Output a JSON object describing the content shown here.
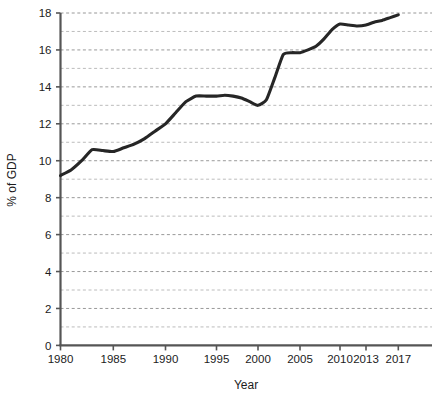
{
  "chart_data": {
    "type": "line",
    "title": "",
    "xlabel": "Year",
    "ylabel": "% of GDP",
    "xlim": [
      1980,
      2018.5
    ],
    "ylim": [
      0,
      18
    ],
    "grid": true,
    "grid_axis": "y",
    "legend": "none",
    "line_color": "#262626",
    "x_tick_labels": [
      "1980",
      "1985",
      "1990",
      "1995",
      "2000",
      "2005",
      "2010",
      "2013",
      "2017"
    ],
    "x_ticks": [
      1980,
      1985,
      1990,
      1995,
      2000,
      2005,
      2010,
      2013,
      2017
    ],
    "y_tick_labels": [
      "0",
      "2",
      "4",
      "6",
      "8",
      "10",
      "12",
      "14",
      "16",
      "18"
    ],
    "y_ticks": [
      0,
      2,
      4,
      6,
      8,
      10,
      12,
      14,
      16,
      18
    ],
    "y_gridlines": [
      1,
      2,
      3,
      4,
      5,
      6,
      7,
      8,
      9,
      10,
      11,
      12,
      13,
      14,
      15,
      16,
      17,
      18
    ],
    "x": [
      1980,
      1981,
      1982,
      1983,
      1984,
      1985,
      1986,
      1987,
      1988,
      1989,
      1990,
      1991,
      1992,
      1993,
      1994,
      1995,
      1996,
      1997,
      1998,
      1999,
      2000,
      2001,
      2002,
      2003,
      2004,
      2005,
      2006,
      2007,
      2008,
      2009,
      2010,
      2011,
      2012,
      2013,
      2014,
      2015,
      2016,
      2017
    ],
    "values": [
      9.2,
      9.5,
      10.0,
      10.6,
      10.55,
      10.5,
      10.7,
      10.9,
      11.2,
      11.6,
      12.0,
      12.6,
      13.2,
      13.5,
      13.5,
      13.5,
      13.55,
      13.5,
      13.4,
      13.2,
      13.0,
      13.3,
      14.5,
      15.75,
      15.85,
      15.85,
      16.0,
      16.2,
      16.6,
      17.1,
      17.4,
      17.35,
      17.3,
      17.35,
      17.5,
      17.6,
      17.75,
      17.9
    ],
    "series_name": "Health expenditure"
  }
}
